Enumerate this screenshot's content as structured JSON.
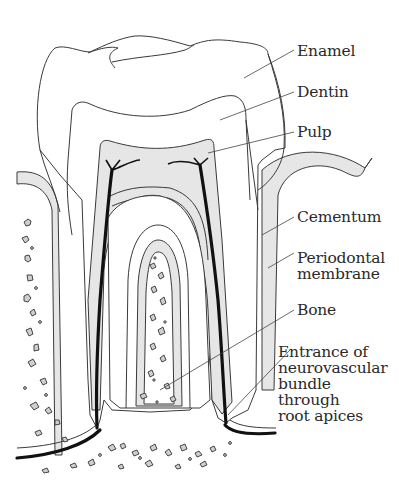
{
  "figure": {
    "colors": {
      "outline": "#3a3a3a",
      "shade": "#e6e6e6",
      "nerve": "#111111",
      "background": "#ffffff",
      "text": "#2a2a2a"
    }
  },
  "labels": [
    {
      "id": "enamel",
      "lines": [
        "Enamel"
      ]
    },
    {
      "id": "dentin",
      "lines": [
        "Dentin"
      ]
    },
    {
      "id": "pulp",
      "lines": [
        "Pulp"
      ]
    },
    {
      "id": "cementum",
      "lines": [
        "Cementum"
      ]
    },
    {
      "id": "periodontal",
      "lines": [
        "Periodontal",
        "membrane"
      ]
    },
    {
      "id": "bone",
      "lines": [
        "Bone"
      ]
    },
    {
      "id": "entrance",
      "lines": [
        "Entrance of",
        "neurovascular",
        "bundle",
        "through",
        "root apices"
      ]
    }
  ]
}
